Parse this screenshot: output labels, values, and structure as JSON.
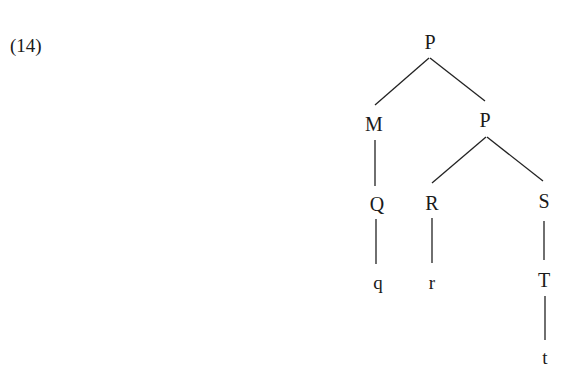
{
  "example_number": "(14)",
  "tree": {
    "nodes": [
      {
        "id": "n0",
        "label": "P",
        "x": 430,
        "y": 42,
        "kind": "category"
      },
      {
        "id": "n1",
        "label": "M",
        "x": 374,
        "y": 124,
        "kind": "category"
      },
      {
        "id": "n2",
        "label": "P",
        "x": 485,
        "y": 120,
        "kind": "category"
      },
      {
        "id": "n3",
        "label": "Q",
        "x": 377,
        "y": 204,
        "kind": "category"
      },
      {
        "id": "n4",
        "label": "R",
        "x": 432,
        "y": 203,
        "kind": "category"
      },
      {
        "id": "n5",
        "label": "S",
        "x": 544,
        "y": 201,
        "kind": "category"
      },
      {
        "id": "n6",
        "label": "q",
        "x": 378,
        "y": 283,
        "kind": "terminal"
      },
      {
        "id": "n7",
        "label": "r",
        "x": 432,
        "y": 283,
        "kind": "terminal"
      },
      {
        "id": "n8",
        "label": "T",
        "x": 544,
        "y": 280,
        "kind": "category"
      },
      {
        "id": "n9",
        "label": "t",
        "x": 545,
        "y": 358,
        "kind": "terminal"
      }
    ],
    "edges": [
      {
        "from": "n0",
        "to": "n1",
        "x1": 429,
        "y1": 58,
        "x2": 375,
        "y2": 105
      },
      {
        "from": "n0",
        "to": "n2",
        "x1": 430,
        "y1": 58,
        "x2": 485,
        "y2": 101
      },
      {
        "from": "n1",
        "to": "n3",
        "x1": 375,
        "y1": 140,
        "x2": 375,
        "y2": 186
      },
      {
        "from": "n2",
        "to": "n4",
        "x1": 486,
        "y1": 137,
        "x2": 432,
        "y2": 183
      },
      {
        "from": "n2",
        "to": "n5",
        "x1": 487,
        "y1": 137,
        "x2": 543,
        "y2": 181
      },
      {
        "from": "n3",
        "to": "n6",
        "x1": 376,
        "y1": 219,
        "x2": 376,
        "y2": 264
      },
      {
        "from": "n4",
        "to": "n7",
        "x1": 432,
        "y1": 218,
        "x2": 432,
        "y2": 263
      },
      {
        "from": "n5",
        "to": "n8",
        "x1": 544,
        "y1": 221,
        "x2": 544,
        "y2": 260
      },
      {
        "from": "n8",
        "to": "n9",
        "x1": 545,
        "y1": 296,
        "x2": 545,
        "y2": 340
      }
    ]
  }
}
